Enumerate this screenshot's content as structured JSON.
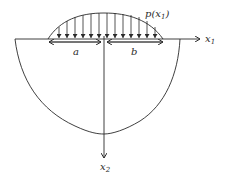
{
  "diagram": {
    "type": "contact-load-on-half-space",
    "labels": {
      "load": "p(x",
      "load_sub": "1",
      "load_close": ")",
      "axis_x1": "x",
      "axis_x1_sub": "1",
      "axis_x2": "x",
      "axis_x2_sub": "2",
      "dim_a": "a",
      "dim_b": "b"
    },
    "colors": {
      "stroke": "#2a2a2a",
      "background": "#ffffff"
    },
    "load_arrow_count": 15
  }
}
